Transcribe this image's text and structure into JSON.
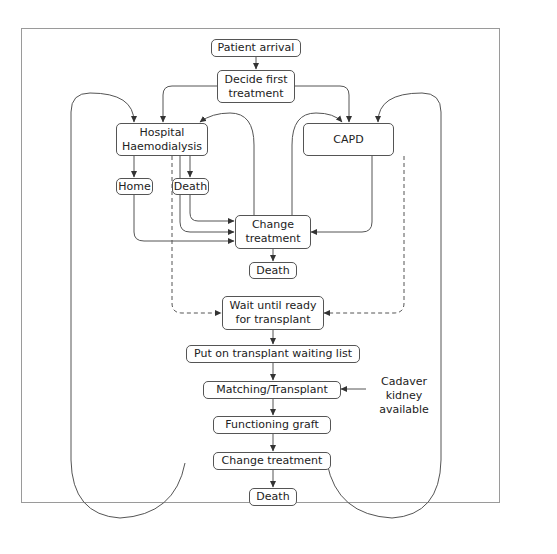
{
  "diagram": {
    "type": "flowchart",
    "colors": {
      "line": "#555555",
      "frame": "#9a9a9a",
      "background": "#ffffff"
    },
    "nodes": {
      "patient_arrival": "Patient arrival",
      "decide_first_treatment": "Decide first\ntreatment",
      "hospital_haemodialysis": "Hospital\nHaemodialysis",
      "capd": "CAPD",
      "home": "Home",
      "death_hd": "Death",
      "change_treatment_upper": "Change\ntreatment",
      "death_mid": "Death",
      "wait_until_ready": "Wait until ready\nfor transplant",
      "waiting_list": "Put on transplant waiting list",
      "matching_transplant": "Matching/Transplant",
      "functioning_graft": "Functioning graft",
      "change_treatment_lower": "Change treatment",
      "death_bottom": "Death"
    },
    "annotations": {
      "cadaver_kidney": "Cadaver\nkidney\navailable"
    },
    "edges": [
      {
        "from": "Patient arrival",
        "to": "Decide first treatment",
        "style": "solid"
      },
      {
        "from": "Decide first treatment",
        "to": "Hospital Haemodialysis",
        "style": "solid"
      },
      {
        "from": "Decide first treatment",
        "to": "CAPD",
        "style": "solid"
      },
      {
        "from": "Hospital Haemodialysis",
        "to": "Home",
        "style": "solid"
      },
      {
        "from": "Hospital Haemodialysis",
        "to": "Death",
        "style": "solid"
      },
      {
        "from": "Hospital Haemodialysis",
        "to": "Change treatment",
        "style": "solid"
      },
      {
        "from": "Home",
        "to": "Change treatment",
        "style": "solid"
      },
      {
        "from": "Death",
        "to": "Change treatment",
        "style": "solid"
      },
      {
        "from": "CAPD",
        "to": "Change treatment",
        "style": "solid"
      },
      {
        "from": "Change treatment",
        "to": "Hospital Haemodialysis",
        "style": "solid"
      },
      {
        "from": "Change treatment",
        "to": "CAPD",
        "style": "solid"
      },
      {
        "from": "Change treatment",
        "to": "Death",
        "style": "solid"
      },
      {
        "from": "Hospital Haemodialysis",
        "to": "Wait until ready for transplant",
        "style": "dashed"
      },
      {
        "from": "CAPD",
        "to": "Wait until ready for transplant",
        "style": "dashed"
      },
      {
        "from": "Wait until ready for transplant",
        "to": "Put on transplant waiting list",
        "style": "solid"
      },
      {
        "from": "Put on transplant waiting list",
        "to": "Matching/Transplant",
        "style": "solid"
      },
      {
        "from": "Cadaver kidney available",
        "to": "Matching/Transplant",
        "style": "solid"
      },
      {
        "from": "Matching/Transplant",
        "to": "Functioning graft",
        "style": "solid"
      },
      {
        "from": "Functioning graft",
        "to": "Change treatment",
        "style": "solid"
      },
      {
        "from": "Change treatment",
        "to": "Death",
        "style": "solid"
      },
      {
        "from": "Change treatment (lower)",
        "to": "Hospital Haemodialysis",
        "style": "solid"
      },
      {
        "from": "Change treatment (lower)",
        "to": "CAPD",
        "style": "solid"
      }
    ]
  }
}
